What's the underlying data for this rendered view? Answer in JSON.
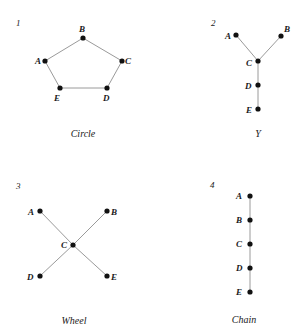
{
  "colors": {
    "edge": "#9a9a9a",
    "node": "#111111",
    "text": "#1a1a1a",
    "background": "#ffffff"
  },
  "panels": [
    {
      "number": "1",
      "caption": "Circle",
      "nodes": [
        {
          "id": "A",
          "x": 45,
          "y": 61
        },
        {
          "id": "B",
          "x": 83,
          "y": 38
        },
        {
          "id": "C",
          "x": 122,
          "y": 61
        },
        {
          "id": "D",
          "x": 107,
          "y": 88
        },
        {
          "id": "E",
          "x": 60,
          "y": 88
        }
      ],
      "edges": [
        [
          "A",
          "B"
        ],
        [
          "B",
          "C"
        ],
        [
          "C",
          "D"
        ],
        [
          "D",
          "E"
        ],
        [
          "E",
          "A"
        ]
      ]
    },
    {
      "number": "2",
      "caption": "Y",
      "nodes": [
        {
          "id": "A",
          "x": 236,
          "y": 35
        },
        {
          "id": "B",
          "x": 281,
          "y": 36
        },
        {
          "id": "C",
          "x": 258,
          "y": 61
        },
        {
          "id": "D",
          "x": 258,
          "y": 85
        },
        {
          "id": "E",
          "x": 258,
          "y": 109
        }
      ],
      "edges": [
        [
          "A",
          "C"
        ],
        [
          "B",
          "C"
        ],
        [
          "C",
          "D"
        ],
        [
          "D",
          "E"
        ]
      ]
    },
    {
      "number": "3",
      "caption": "Wheel",
      "nodes": [
        {
          "id": "A",
          "x": 40,
          "y": 211
        },
        {
          "id": "B",
          "x": 107,
          "y": 211
        },
        {
          "id": "C",
          "x": 73,
          "y": 245
        },
        {
          "id": "D",
          "x": 40,
          "y": 276
        },
        {
          "id": "E",
          "x": 107,
          "y": 276
        }
      ],
      "edges": [
        [
          "A",
          "C"
        ],
        [
          "B",
          "C"
        ],
        [
          "D",
          "C"
        ],
        [
          "E",
          "C"
        ]
      ]
    },
    {
      "number": "4",
      "caption": "Chain",
      "nodes": [
        {
          "id": "A",
          "x": 250,
          "y": 196
        },
        {
          "id": "B",
          "x": 250,
          "y": 220
        },
        {
          "id": "C",
          "x": 250,
          "y": 244
        },
        {
          "id": "D",
          "x": 250,
          "y": 268
        },
        {
          "id": "E",
          "x": 250,
          "y": 292
        }
      ],
      "edges": [
        [
          "A",
          "B"
        ],
        [
          "B",
          "C"
        ],
        [
          "C",
          "D"
        ],
        [
          "D",
          "E"
        ]
      ]
    }
  ]
}
